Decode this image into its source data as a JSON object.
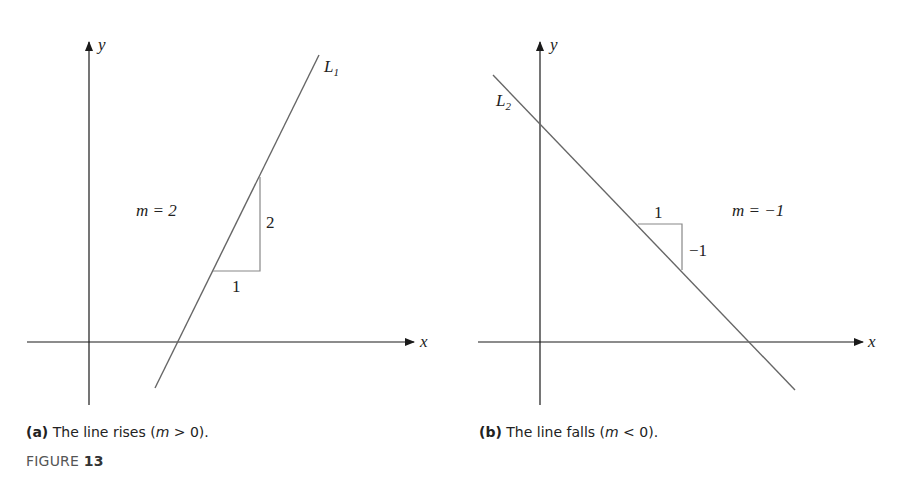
{
  "panels": [
    {
      "id": "a",
      "line_label": "L",
      "line_subscript": "1",
      "slope_label": "m = 2",
      "rise_label": "2",
      "run_label": "1",
      "x_axis_label": "x",
      "y_axis_label": "y",
      "caption_prefix": "(a)",
      "caption_text": " The line rises (",
      "caption_var": "m",
      "caption_rel": " > 0).",
      "slope": 2
    },
    {
      "id": "b",
      "line_label": "L",
      "line_subscript": "2",
      "slope_label": "m = −1",
      "rise_label": "−1",
      "run_label": "1",
      "x_axis_label": "x",
      "y_axis_label": "y",
      "caption_prefix": "(b)",
      "caption_text": " The line falls (",
      "caption_var": "m",
      "caption_rel": " < 0).",
      "slope": -1
    }
  ],
  "figure": {
    "label": "FIGURE",
    "number": "13"
  },
  "colors": {
    "axis": "#1a1a1a",
    "line": "#666666",
    "triangle": "#888888",
    "text": "#222222"
  }
}
